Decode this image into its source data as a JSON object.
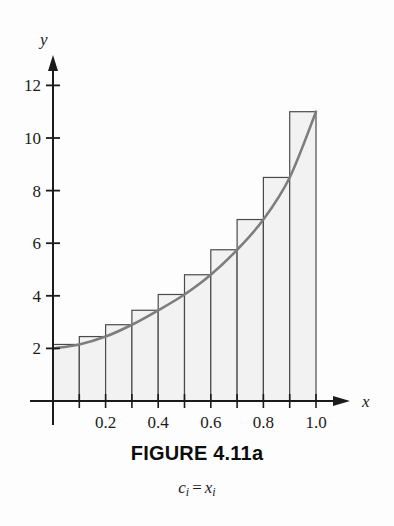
{
  "figure": {
    "title": "FIGURE 4.11a",
    "subcaption_left": "c",
    "subcaption_left_sub": "i",
    "subcaption_eq": "=",
    "subcaption_right": "x",
    "subcaption_right_sub": "i",
    "subcaption_full": "c_i = x_i"
  },
  "axes": {
    "x_axis_label": "x",
    "y_axis_label": "y",
    "x_tick_labels": [
      "0.2",
      "0.4",
      "0.6",
      "0.8",
      "1.0"
    ],
    "y_tick_labels": [
      "2",
      "4",
      "6",
      "8",
      "10",
      "12"
    ]
  },
  "colors": {
    "axis": "#1b1b1b",
    "curve": "#7d7d7d",
    "bar_fill": "#f2f2f2",
    "bar_stroke": "#4a4a4a",
    "text": "#1b1b1b",
    "background": "#fdfdfd"
  },
  "chart_data": {
    "type": "bar",
    "title": "FIGURE 4.11a",
    "subtitle": "c_i = x_i",
    "xlabel": "x",
    "ylabel": "y",
    "xlim": [
      0,
      1.05
    ],
    "ylim": [
      0,
      12.6
    ],
    "grid": false,
    "legend": "none",
    "x_ticks": [
      0.2,
      0.4,
      0.6,
      0.8,
      1.0
    ],
    "y_ticks": [
      2,
      4,
      6,
      8,
      10,
      12
    ],
    "bar_edges": [
      0.0,
      0.1,
      0.2,
      0.3,
      0.4,
      0.5,
      0.6,
      0.7,
      0.8,
      0.9,
      1.0
    ],
    "categories": [
      "0.0-0.1",
      "0.1-0.2",
      "0.2-0.3",
      "0.3-0.4",
      "0.4-0.5",
      "0.5-0.6",
      "0.6-0.7",
      "0.7-0.8",
      "0.8-0.9",
      "0.9-1.0"
    ],
    "values": [
      2.15,
      2.45,
      2.9,
      3.45,
      4.05,
      4.8,
      5.75,
      6.9,
      8.5,
      11.0
    ],
    "series": [
      {
        "name": "curve",
        "type": "line",
        "x": [
          0.0,
          0.1,
          0.2,
          0.3,
          0.4,
          0.5,
          0.6,
          0.7,
          0.8,
          0.9,
          1.0
        ],
        "values": [
          2.0,
          2.15,
          2.45,
          2.9,
          3.45,
          4.05,
          4.8,
          5.75,
          6.9,
          8.5,
          11.0
        ]
      }
    ]
  }
}
